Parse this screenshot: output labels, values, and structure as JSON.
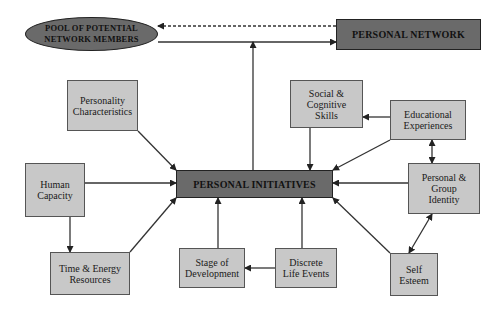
{
  "diagram": {
    "colors": {
      "dark_node": "#6a6a6a",
      "light_node": "#c8c8c8",
      "line": "#333333"
    },
    "nodes": {
      "pool": {
        "label": "POOL OF POTENTIAL\nNETWORK MEMBERS"
      },
      "personal_network": {
        "label": "PERSONAL NETWORK"
      },
      "personality": {
        "label": "Personality\nCharacteristics"
      },
      "social_cognitive": {
        "label": "Social &\nCognitive\nSkills"
      },
      "educational": {
        "label": "Educational\nExperiences"
      },
      "human_capacity": {
        "label": "Human\nCapacity"
      },
      "personal_initiatives": {
        "label": "PERSONAL INITIATIVES"
      },
      "identity": {
        "label": "Personal &\nGroup\nIdentity"
      },
      "time_energy": {
        "label": "Time & Energy\nResources"
      },
      "stage": {
        "label": "Stage of\nDevelopment"
      },
      "life_events": {
        "label": "Discrete\nLife Events"
      },
      "self_esteem": {
        "label": "Self\nEsteem"
      }
    },
    "edges": [
      {
        "from": "personal_network",
        "to": "pool",
        "style": "dashed"
      },
      {
        "from": "pool",
        "to": "personal_network",
        "style": "solid"
      },
      {
        "from": "personal_initiatives",
        "to": "pool_network_link",
        "style": "solid"
      },
      {
        "from": "personality",
        "to": "personal_initiatives",
        "style": "solid"
      },
      {
        "from": "social_cognitive",
        "to": "personal_initiatives",
        "style": "solid"
      },
      {
        "from": "educational",
        "to": "social_cognitive",
        "style": "solid"
      },
      {
        "from": "educational",
        "to": "personal_initiatives",
        "style": "solid"
      },
      {
        "from": "educational",
        "to": "identity",
        "style": "solid",
        "bidirectional": true
      },
      {
        "from": "human_capacity",
        "to": "personal_initiatives",
        "style": "solid"
      },
      {
        "from": "human_capacity",
        "to": "time_energy",
        "style": "solid"
      },
      {
        "from": "time_energy",
        "to": "personal_initiatives",
        "style": "solid"
      },
      {
        "from": "stage",
        "to": "personal_initiatives",
        "style": "solid"
      },
      {
        "from": "life_events",
        "to": "personal_initiatives",
        "style": "solid"
      },
      {
        "from": "life_events",
        "to": "stage",
        "style": "solid"
      },
      {
        "from": "identity",
        "to": "personal_initiatives",
        "style": "solid"
      },
      {
        "from": "identity",
        "to": "self_esteem",
        "style": "solid",
        "bidirectional": true
      },
      {
        "from": "self_esteem",
        "to": "personal_initiatives",
        "style": "solid"
      }
    ]
  }
}
